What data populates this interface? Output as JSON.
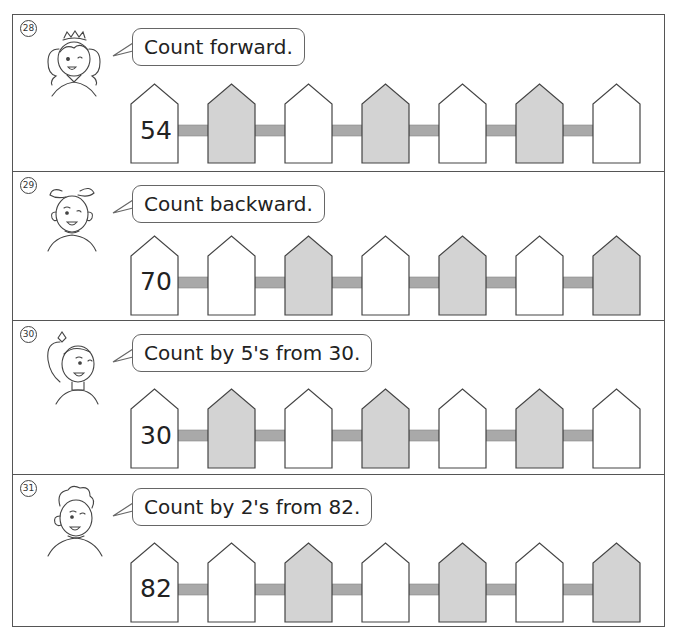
{
  "colors": {
    "frame": "#555555",
    "picket_stroke": "#444444",
    "picket_gray": "#d3d3d3",
    "picket_white": "#ffffff",
    "rail": "#a9a9a9"
  },
  "questions": [
    {
      "number": "28",
      "badge": "㉘",
      "character": "girl-with-crown",
      "instruction": "Count forward.",
      "start": "54",
      "pickets": [
        "white",
        "gray",
        "white",
        "gray",
        "white",
        "gray",
        "white"
      ]
    },
    {
      "number": "29",
      "badge": "㉙",
      "character": "girl-with-bow",
      "instruction": "Count backward.",
      "start": "70",
      "pickets": [
        "white",
        "white",
        "gray",
        "white",
        "gray",
        "white",
        "gray"
      ]
    },
    {
      "number": "30",
      "badge": "㉚",
      "character": "girl-with-ponytail",
      "instruction": "Count by 5's from 30.",
      "start": "30",
      "pickets": [
        "white",
        "gray",
        "white",
        "gray",
        "white",
        "gray",
        "white"
      ]
    },
    {
      "number": "31",
      "badge": "㉛",
      "character": "boy",
      "instruction": "Count by 2's from 82.",
      "start": "82",
      "pickets": [
        "white",
        "white",
        "gray",
        "white",
        "gray",
        "white",
        "gray"
      ]
    }
  ]
}
